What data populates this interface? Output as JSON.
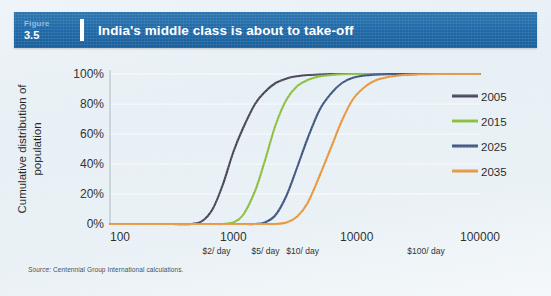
{
  "header": {
    "figure_word": "Figure",
    "figure_number": "3.5",
    "title": "India's middle class is about to take-off"
  },
  "source": {
    "label": "Source:",
    "text": " Centennial Group International calculations."
  },
  "colors": {
    "header_blue": "#1f6aa8",
    "background": "#e9f1f6",
    "series_2005": "#4a4458",
    "series_2015": "#8cbe3f",
    "series_2025": "#3f5580",
    "series_2035": "#e8963c",
    "axis": "#9aa7b0",
    "grid": "#f2f7fa",
    "text": "#1f1f1f"
  },
  "chart_data": {
    "type": "line",
    "title": "India's middle class is about to take-off",
    "xlabel": "Annual Consumption (2005$ PPP, log scale)",
    "ylabel": "Cumulative distribution of population",
    "xscale": "log",
    "xlim": [
      100,
      100000
    ],
    "ylim": [
      0,
      100
    ],
    "grid": true,
    "legend_position": "right",
    "x_ticks": [
      {
        "value": 100,
        "label": "100",
        "sub_label": ""
      },
      {
        "value": 1000,
        "label": "1000",
        "sub_label": ""
      },
      {
        "value": 10000,
        "label": "10000",
        "sub_label": ""
      },
      {
        "value": 100000,
        "label": "100000",
        "sub_label": ""
      }
    ],
    "x_annotations": [
      {
        "value": 730,
        "label": "$2/ day"
      },
      {
        "value": 1825,
        "label": "$5/ day"
      },
      {
        "value": 3650,
        "label": "$10/ day"
      },
      {
        "value": 36500,
        "label": "$100/ day"
      }
    ],
    "y_ticks": [
      {
        "value": 0,
        "label": "0%"
      },
      {
        "value": 20,
        "label": "20%"
      },
      {
        "value": 40,
        "label": "40%"
      },
      {
        "value": 60,
        "label": "60%"
      },
      {
        "value": 80,
        "label": "80%"
      },
      {
        "value": 100,
        "label": "100%"
      }
    ],
    "x": [
      100,
      150,
      220,
      320,
      460,
      560,
      680,
      820,
      1000,
      1200,
      1500,
      1800,
      2200,
      2700,
      3300,
      4000,
      5000,
      6200,
      7600,
      9300,
      11500,
      14000,
      18000,
      24000,
      32000,
      45000,
      65000,
      100000
    ],
    "series": [
      {
        "name": "2005",
        "color": "#4a4458",
        "values": [
          0,
          0,
          0,
          0,
          0,
          2,
          10,
          26,
          48,
          64,
          80,
          88,
          94,
          97,
          98.5,
          99.3,
          99.7,
          99.9,
          100,
          100,
          100,
          100,
          100,
          100,
          100,
          100,
          100,
          100
        ]
      },
      {
        "name": "2015",
        "color": "#8cbe3f",
        "values": [
          0,
          0,
          0,
          0,
          0,
          0,
          0,
          0,
          1,
          6,
          22,
          42,
          66,
          83,
          92,
          96,
          98.4,
          99.3,
          99.8,
          100,
          100,
          100,
          100,
          100,
          100,
          100,
          100,
          100
        ]
      },
      {
        "name": "2025",
        "color": "#3f5580",
        "values": [
          0,
          0,
          0,
          0,
          0,
          0,
          0,
          0,
          0,
          0,
          0,
          1,
          6,
          19,
          38,
          57,
          76,
          87,
          94,
          97.5,
          99,
          99.6,
          99.9,
          100,
          100,
          100,
          100,
          100
        ]
      },
      {
        "name": "2035",
        "color": "#e8963c",
        "values": [
          0,
          0,
          0,
          0,
          0,
          0,
          0,
          0,
          0,
          0,
          0,
          0,
          0,
          1,
          5,
          14,
          32,
          51,
          69,
          83,
          91,
          95.5,
          98,
          99.3,
          99.8,
          100,
          100,
          100
        ]
      }
    ],
    "legend": [
      {
        "label": "2005",
        "color": "#4a4458"
      },
      {
        "label": "2015",
        "color": "#8cbe3f"
      },
      {
        "label": "2025",
        "color": "#3f5580"
      },
      {
        "label": "2035",
        "color": "#e8963c"
      }
    ]
  }
}
